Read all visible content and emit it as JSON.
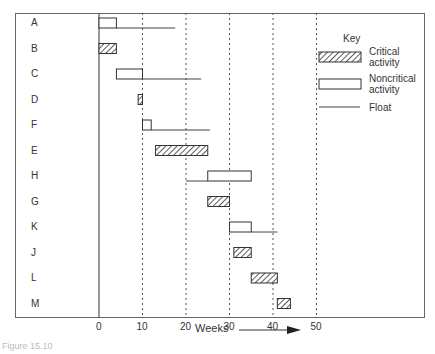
{
  "figure": {
    "caption": "Figure 15.10"
  },
  "chart_data": {
    "type": "gantt",
    "title": "",
    "xlabel": "Weeks",
    "ylabel": "",
    "x_ticks": [
      0,
      10,
      20,
      30,
      40,
      50
    ],
    "xlim": [
      0,
      50
    ],
    "grid": "dashed vertical at 10, 20, 30, 40, 50",
    "legend": {
      "title": "Key",
      "position": "upper right",
      "entries": [
        {
          "style": "hatched",
          "label_line1": "Critical",
          "label_line2": "activity"
        },
        {
          "style": "open",
          "label_line1": "Noncritical",
          "label_line2": "activity"
        },
        {
          "style": "line",
          "label_line1": "Float",
          "label_line2": ""
        }
      ]
    },
    "activities": [
      {
        "name": "A",
        "type": "noncritical",
        "start": 0,
        "end": 4,
        "float_start": 4,
        "float_end": 17.5
      },
      {
        "name": "B",
        "type": "critical",
        "start": 0,
        "end": 4
      },
      {
        "name": "C",
        "type": "noncritical",
        "start": 4,
        "end": 10,
        "float_start": 10,
        "float_end": 23.5
      },
      {
        "name": "D",
        "type": "critical",
        "start": 9,
        "end": 10
      },
      {
        "name": "F",
        "type": "noncritical",
        "start": 10,
        "end": 12,
        "float_start": 12,
        "float_end": 25.5
      },
      {
        "name": "E",
        "type": "critical",
        "start": 13,
        "end": 25
      },
      {
        "name": "H",
        "type": "noncritical",
        "start": 25,
        "end": 35,
        "float_start": 20,
        "float_end": 25
      },
      {
        "name": "G",
        "type": "critical",
        "start": 25,
        "end": 30
      },
      {
        "name": "K",
        "type": "noncritical",
        "start": 30,
        "end": 35,
        "float_start": 35,
        "float_end": 41
      },
      {
        "name": "J",
        "type": "critical",
        "start": 31,
        "end": 35
      },
      {
        "name": "L",
        "type": "critical",
        "start": 35,
        "end": 41
      },
      {
        "name": "M",
        "type": "critical",
        "start": 41,
        "end": 44
      }
    ]
  }
}
